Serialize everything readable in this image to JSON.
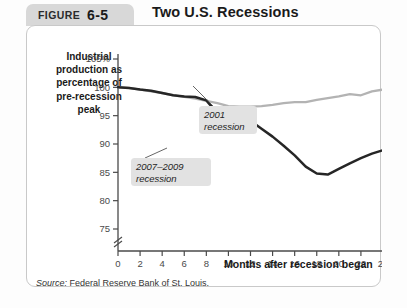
{
  "figure": {
    "tab_word": "FIGURE",
    "tab_number": "6-5",
    "title": "Two U.S. Recessions",
    "source": "Source:",
    "source_text": " Federal Reserve Bank of St. Louis."
  },
  "chart_data": {
    "type": "line",
    "title": "Two U.S. Recessions",
    "xlabel": "Months after recession began",
    "ylabel": "Industrial production as percentage of pre-recession peak",
    "ylabel_lines": [
      "Industrial",
      "production as",
      "percentage of",
      "pre-recession",
      "peak"
    ],
    "xlim": [
      0,
      24
    ],
    "ylim": [
      73,
      105
    ],
    "axis_break": true,
    "grid": false,
    "legend": "annotated-callouts",
    "xticks": [
      0,
      2,
      4,
      6,
      8,
      10,
      12,
      14,
      16,
      18,
      20,
      22,
      24
    ],
    "xticklabels": [
      "0",
      "2",
      "4",
      "6",
      "8",
      "10",
      "12",
      "14",
      "16",
      "18",
      "20",
      "22",
      "24"
    ],
    "yticks": [
      75,
      80,
      85,
      90,
      95,
      100,
      105
    ],
    "yticklabels": [
      "75",
      "80",
      "85",
      "90",
      "95",
      "100",
      "105%"
    ],
    "x": [
      0,
      1,
      2,
      3,
      4,
      5,
      6,
      7,
      8,
      9,
      10,
      11,
      12,
      13,
      14,
      15,
      16,
      17,
      18,
      19,
      20,
      21,
      22,
      23,
      24
    ],
    "series": [
      {
        "name": "2001 recession",
        "color": "#b3b3b3",
        "values": [
          100.0,
          99.9,
          99.6,
          99.3,
          99.0,
          98.6,
          98.3,
          98.0,
          97.6,
          97.2,
          96.7,
          96.6,
          96.6,
          96.7,
          96.9,
          97.2,
          97.4,
          97.4,
          97.8,
          98.1,
          98.4,
          98.8,
          98.6,
          99.3,
          99.6
        ]
      },
      {
        "name": "2007–2009 recession",
        "color": "#262626",
        "values": [
          100.0,
          99.9,
          99.6,
          99.4,
          99.0,
          98.6,
          98.4,
          98.3,
          97.7,
          95.4,
          92.5,
          93.6,
          94.1,
          92.7,
          91.3,
          89.7,
          88.0,
          86.0,
          84.8,
          84.6,
          85.6,
          86.6,
          87.5,
          88.3,
          88.9
        ]
      }
    ],
    "annotations": [
      {
        "label_lines": [
          "2001",
          "recession"
        ],
        "series": "2001 recession"
      },
      {
        "label_lines": [
          "2007–2009",
          "recession"
        ],
        "series": "2007–2009 recession"
      }
    ]
  }
}
